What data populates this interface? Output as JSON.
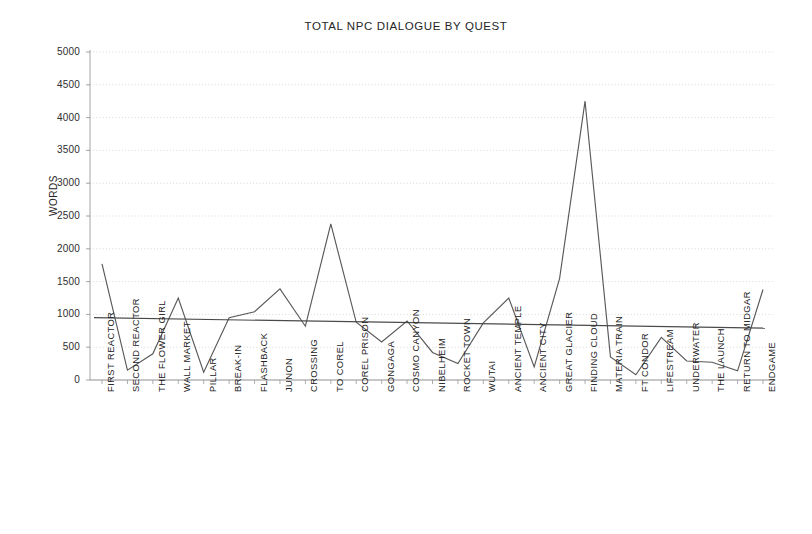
{
  "chart_data": {
    "type": "line",
    "title": "TOTAL NPC DIALOGUE BY QUEST",
    "xlabel": "",
    "ylabel": "WORDS",
    "ylim": [
      0,
      5000
    ],
    "ytick_step": 500,
    "yticks": [
      "5000",
      "4500",
      "4000",
      "3500",
      "3000",
      "2500",
      "2000",
      "1500",
      "1000",
      "500",
      "0"
    ],
    "grid": true,
    "legend": "none",
    "categories": [
      "FIRST REACTOR",
      "SECOND REACTOR",
      "THE FLOWER GIRL",
      "WALL MARKET",
      "PILLAR",
      "BREAK-IN",
      "FLASHBACK",
      "JUNON",
      "CROSSING",
      "TO COREL",
      "COREL PRISON",
      "GONGAGA",
      "COSMO CANYON",
      "NIBELHEIM",
      "ROCKET TOWN",
      "WUTAI",
      "ANCIENT TEMPLE",
      "ANCIENT CITY",
      "GREAT GLACIER",
      "FINDING CLOUD",
      "MATERIA TRAIN",
      "FT CONDOR",
      "LIFESTREAM",
      "UNDERWATER",
      "THE LAUNCH",
      "RETURN TO MIDGAR",
      "ENDGAME"
    ],
    "series": [
      {
        "name": "WORDS",
        "values": [
          1770,
          150,
          400,
          1250,
          120,
          950,
          1040,
          1390,
          820,
          2380,
          880,
          580,
          900,
          420,
          250,
          870,
          1250,
          200,
          1550,
          4250,
          350,
          80,
          650,
          290,
          270,
          140,
          1380
        ],
        "color": "#595959"
      },
      {
        "name": "TRENDLINE",
        "type": "linear-trend",
        "start_value": 950,
        "end_value": 790,
        "color": "#4a4a4a"
      }
    ],
    "colors": {
      "line": "#595959",
      "trendline": "#4a4a4a",
      "grid": "#c9c9c9",
      "axis": "#9a9a9a",
      "text": "#262626",
      "background": "#ffffff"
    }
  }
}
